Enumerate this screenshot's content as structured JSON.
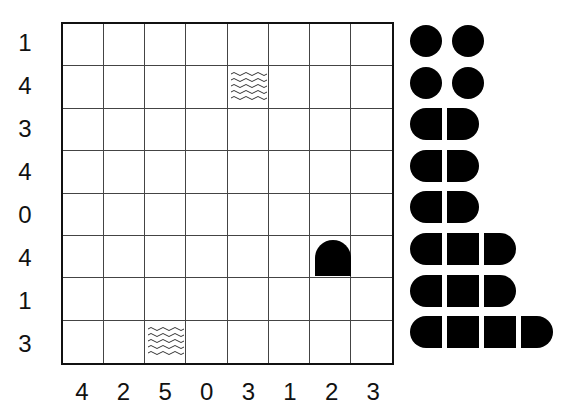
{
  "puzzle": {
    "type": "battleship",
    "size": 8,
    "row_clues": [
      "1",
      "4",
      "3",
      "4",
      "0",
      "4",
      "1",
      "3"
    ],
    "col_clues": [
      "4",
      "2",
      "5",
      "0",
      "3",
      "1",
      "2",
      "3"
    ],
    "given_cells": [
      {
        "row": 1,
        "col": 4,
        "content": "water"
      },
      {
        "row": 5,
        "col": 6,
        "content": "ship-top-end"
      },
      {
        "row": 7,
        "col": 2,
        "content": "water"
      }
    ]
  },
  "fleet": [
    {
      "length": 1,
      "count": 4
    },
    {
      "length": 2,
      "count": 3
    },
    {
      "length": 3,
      "count": 2
    },
    {
      "length": 4,
      "count": 1
    }
  ],
  "colors": {
    "ink": "#000000",
    "grid_line": "#444444",
    "background": "#ffffff"
  }
}
